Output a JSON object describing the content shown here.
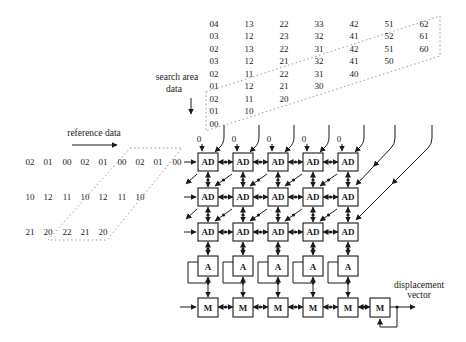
{
  "diagram": {
    "labels": {
      "search_area_line1": "search area",
      "search_area_line2": "data",
      "reference_data": "reference data",
      "displacement_line1": "displacement",
      "displacement_line2": "vector"
    },
    "array_inputs": {
      "zero_label": "0"
    },
    "cells": {
      "ad_label": "AD",
      "acc_label": "A",
      "min_label": "M"
    },
    "search_area": {
      "rows": [
        [
          "04",
          "13",
          "22",
          "33",
          "42",
          "51",
          "62"
        ],
        [
          "03",
          "12",
          "23",
          "32",
          "41",
          "52",
          "61"
        ],
        [
          "02",
          "13",
          "22",
          "31",
          "42",
          "51",
          "60"
        ],
        [
          "03",
          "12",
          "21",
          "32",
          "41",
          "50"
        ],
        [
          "02",
          "11",
          "22",
          "31",
          "40"
        ],
        [
          "01",
          "12",
          "21",
          "30"
        ],
        [
          "02",
          "11",
          "20"
        ],
        [
          "01",
          "10"
        ],
        [
          "00"
        ]
      ]
    },
    "reference": {
      "rows": [
        [
          "02",
          "01",
          "00",
          "02",
          "01",
          "00",
          "02",
          "01",
          "00"
        ],
        [
          "10",
          "12",
          "11",
          "10",
          "12",
          "11",
          "10"
        ],
        [
          "21",
          "20",
          "22",
          "21",
          "20"
        ]
      ]
    },
    "colors": {
      "ink": "#1a1a1a",
      "dotted": "#8f8f8f",
      "bg": "#ffffff"
    }
  }
}
